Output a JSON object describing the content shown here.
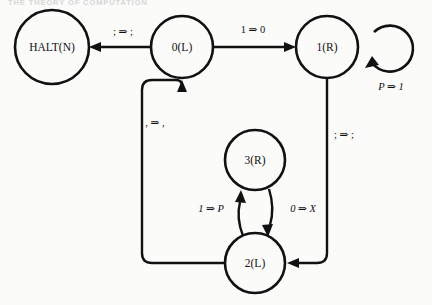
{
  "header": {
    "text": "THE THEORY OF COMPUTATION"
  },
  "diagram": {
    "stroke_color": "#111111",
    "background_color": "#fbfbfa",
    "nodes": [
      {
        "id": "halt",
        "label": "HALT(N)",
        "cx": 52,
        "cy": 47,
        "r": 37
      },
      {
        "id": "s0",
        "label": "0(L)",
        "cx": 182,
        "cy": 47,
        "r": 31
      },
      {
        "id": "s1",
        "label": "1(R)",
        "cx": 327,
        "cy": 47,
        "r": 31
      },
      {
        "id": "s3",
        "label": "3(R)",
        "cx": 255,
        "cy": 160,
        "r": 30
      },
      {
        "id": "s2",
        "label": "2(L)",
        "cx": 255,
        "cy": 263,
        "r": 30
      }
    ],
    "edges": [
      {
        "id": "e-0-halt",
        "from": "s0",
        "to": "halt",
        "label": "; ⇒ ;",
        "label_x": 123,
        "label_y": 33
      },
      {
        "id": "e-0-1",
        "from": "s0",
        "to": "s1",
        "label": "1 ⇒ 0",
        "label_x": 253,
        "label_y": 31
      },
      {
        "id": "e-1-1",
        "from": "s1",
        "to": "s1",
        "label": "P ⇒ 1",
        "label_x": 391,
        "label_y": 88,
        "self_loop": true,
        "italic": true
      },
      {
        "id": "e-1-2",
        "from": "s1",
        "to": "s2",
        "label": "; ⇒ ;",
        "label_x": 344,
        "label_y": 136
      },
      {
        "id": "e-2-0",
        "from": "s2",
        "to": "s0",
        "label": ", ⇒ ,",
        "label_x": 155,
        "label_y": 124
      },
      {
        "id": "e-2-3",
        "from": "s2",
        "to": "s3",
        "label": "1 ⇒ P",
        "label_x": 211,
        "label_y": 210,
        "italic": true
      },
      {
        "id": "e-3-2",
        "from": "s3",
        "to": "s2",
        "label": "0 ⇒ X",
        "label_x": 303,
        "label_y": 210,
        "italic": true
      }
    ]
  }
}
